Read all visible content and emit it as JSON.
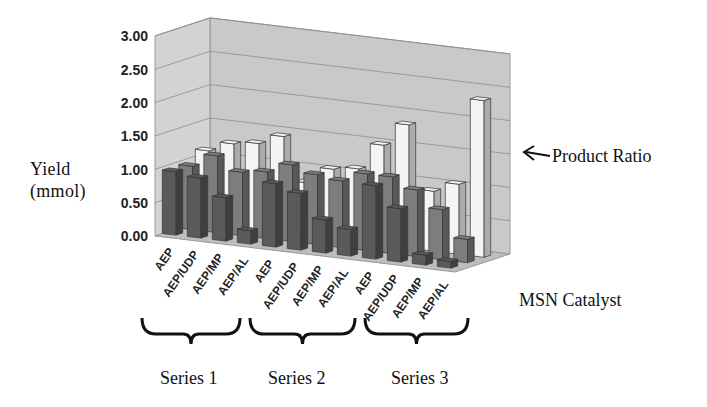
{
  "chart_data": {
    "type": "bar",
    "subtype": "3d-clustered-bar",
    "title": "",
    "ylabel": "Yield (mmol)",
    "xlabel": "MSN Catalyst",
    "ylim": [
      0,
      3.0
    ],
    "yticks": [
      "0.00",
      "0.50",
      "1.00",
      "1.50",
      "2.00",
      "2.50",
      "3.00"
    ],
    "grid": true,
    "categories": [
      "AEP",
      "AEP/UDP",
      "AEP/MP",
      "AEP/AL",
      "AEP",
      "AEP/UDP",
      "AEP/MP",
      "AEP/AL",
      "AEP",
      "AEP/UDP",
      "AEP/MP",
      "AEP/AL"
    ],
    "groups": [
      {
        "label": "Series 1",
        "categories": [
          "AEP",
          "AEP/UDP",
          "AEP/MP",
          "AEP/AL"
        ]
      },
      {
        "label": "Series 2",
        "categories": [
          "AEP",
          "AEP/UDP",
          "AEP/MP",
          "AEP/AL"
        ]
      },
      {
        "label": "Series 3",
        "categories": [
          "AEP",
          "AEP/UDP",
          "AEP/MP",
          "AEP/AL"
        ]
      }
    ],
    "series": [
      {
        "name": "Front (dark)",
        "values": [
          0.95,
          0.9,
          0.65,
          0.2,
          0.95,
          0.85,
          0.5,
          0.4,
          1.1,
          0.8,
          0.15,
          0.1
        ]
      },
      {
        "name": "Middle (gray)",
        "values": [
          0.95,
          1.15,
          0.95,
          1.0,
          1.15,
          1.05,
          1.0,
          1.15,
          1.15,
          1.0,
          0.75,
          0.35
        ]
      },
      {
        "name": "Product Ratio",
        "values": [
          1.1,
          1.25,
          1.3,
          1.45,
          0.8,
          1.05,
          1.1,
          1.5,
          1.85,
          0.9,
          1.05,
          2.35
        ]
      }
    ],
    "annotations": [
      {
        "text": "Product Ratio",
        "arrow_to": "back row (white bars)"
      }
    ],
    "legend": "none"
  },
  "labels": {
    "yaxis_line1": "Yield",
    "yaxis_line2": "(mmol)",
    "xaxis": "MSN Catalyst",
    "product_ratio": "Product Ratio",
    "series1": "Series 1",
    "series2": "Series 2",
    "series3": "Series 3"
  },
  "ticks": {
    "y": [
      "3.00",
      "2.50",
      "2.00",
      "1.50",
      "1.00",
      "0.50",
      "0.00"
    ],
    "x": [
      "AEP",
      "AEP/UDP",
      "AEP/MP",
      "AEP/AL",
      "AEP",
      "AEP/UDP",
      "AEP/MP",
      "AEP/AL",
      "AEP",
      "AEP/UDP",
      "AEP/MP",
      "AEP/AL"
    ]
  },
  "colors": {
    "wall": "#c9c9c9",
    "floor": "#bdbdbd",
    "grid": "#8e8e8e",
    "front": "#5a5a5a",
    "middle": "#7d7d7d",
    "back": "#f4f4f4",
    "edge": "#333333"
  }
}
